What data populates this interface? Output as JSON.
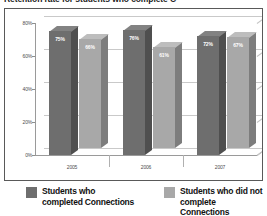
{
  "chart_data": {
    "type": "bar",
    "title": "Retention rate for students who complete C",
    "categories": [
      "2005",
      "2006",
      "2007"
    ],
    "series": [
      {
        "name": "Students who\ncompleted Connections",
        "color": "#6e6e6e",
        "values": [
          75,
          76,
          72
        ],
        "labels": [
          "75%",
          "76%",
          "72%"
        ]
      },
      {
        "name": "Students who did not\ncomplete Connections",
        "color": "#a8a8a8",
        "values": [
          66,
          61,
          67
        ],
        "labels": [
          "66%",
          "61%",
          "67%"
        ]
      }
    ],
    "xlabel": "",
    "ylabel": "",
    "ylim": [
      0,
      80
    ],
    "yticks": [
      0,
      20,
      40,
      60,
      80
    ],
    "ytick_labels": [
      "0%",
      "20%",
      "40%",
      "60%",
      "80%"
    ],
    "grid": true,
    "legend_position": "bottom",
    "style": "3d-clustered-column"
  },
  "legend": {
    "items": [
      {
        "label": "Students who\ncompleted Connections",
        "color": "#6e6e6e"
      },
      {
        "label": "Students who did not\ncomplete Connections",
        "color": "#a8a8a8"
      }
    ]
  }
}
